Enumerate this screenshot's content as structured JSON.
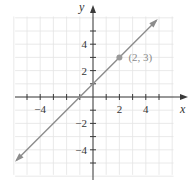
{
  "chart_data": {
    "type": "line",
    "title": "",
    "equation": "y = x + 1",
    "xlabel": "x",
    "ylabel": "y",
    "xlim": [
      -6,
      6
    ],
    "ylim": [
      -6,
      6
    ],
    "grid": true,
    "x_ticks": [
      -5,
      -4,
      -3,
      -2,
      -1,
      1,
      2,
      3,
      4,
      5
    ],
    "y_ticks": [
      -5,
      -4,
      -3,
      -2,
      -1,
      1,
      2,
      3,
      4,
      5
    ],
    "x_tick_labels": [
      {
        "value": -4,
        "label": "−4"
      },
      {
        "value": 2,
        "label": "2"
      },
      {
        "value": 4,
        "label": "4"
      }
    ],
    "y_tick_labels": [
      {
        "value": 4,
        "label": "4"
      },
      {
        "value": 2,
        "label": "2"
      },
      {
        "value": -2,
        "label": "−2"
      },
      {
        "value": -4,
        "label": "−4"
      }
    ],
    "series": [
      {
        "name": "line",
        "x": [
          -5.8,
          -1,
          0,
          2,
          4.8
        ],
        "y": [
          -4.8,
          0,
          1,
          3,
          5.8
        ],
        "arrows": "both"
      }
    ],
    "points": [
      {
        "x": 2,
        "y": 3,
        "label": "(2, 3)"
      }
    ],
    "legend": null
  },
  "colors": {
    "line": "#8c8c8c",
    "axis": "#3a3a3a",
    "grid": "#e4e4e4",
    "point": "#9a9a9a",
    "point_label": "#8a8a8a"
  }
}
